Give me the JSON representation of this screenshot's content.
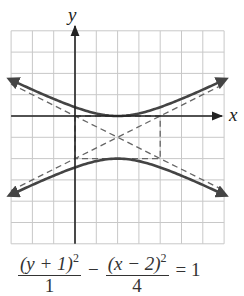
{
  "chart_data": {
    "type": "line",
    "title": "",
    "xlabel": "x",
    "ylabel": "y",
    "xlim": [
      -3,
      7
    ],
    "ylim": [
      -6,
      4
    ],
    "grid": true,
    "grid_step": 1,
    "series": [
      {
        "name": "hyperbola upper branch",
        "style": "solid",
        "equation": "y = -1 + sqrt(1 + (x-2)^2/4)",
        "vertex": [
          2,
          0
        ]
      },
      {
        "name": "hyperbola lower branch",
        "style": "solid",
        "equation": "y = -1 - sqrt(1 + (x-2)^2/4)",
        "vertex": [
          2,
          -2
        ]
      },
      {
        "name": "asymptote 1",
        "style": "dashed",
        "equation": "y = -1 + (x-2)/2"
      },
      {
        "name": "asymptote 2",
        "style": "dashed",
        "equation": "y = -1 - (x-2)/2"
      },
      {
        "name": "fundamental rectangle",
        "style": "dashed",
        "corners": [
          [
            0,
            0
          ],
          [
            4,
            0
          ],
          [
            4,
            -2
          ],
          [
            0,
            -2
          ]
        ]
      }
    ],
    "center": [
      2,
      -1
    ],
    "a": 1,
    "b": 2
  },
  "axes": {
    "x_label": "x",
    "y_label": "y"
  },
  "equation": {
    "term1_numerator": "(y + 1)",
    "term1_exponent": "2",
    "term1_denominator": "1",
    "operator": "−",
    "term2_numerator": "(x − 2)",
    "term2_exponent": "2",
    "term2_denominator": "4",
    "equals": "= 1"
  },
  "colors": {
    "grid": "#c8c8c8",
    "axis": "#222222",
    "curve": "#444444",
    "dashed": "#666666"
  }
}
